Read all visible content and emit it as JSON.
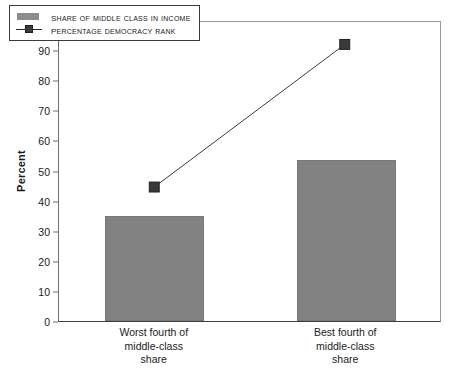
{
  "chart_data": {
    "type": "bar",
    "title": "",
    "subtitle": "",
    "xlabel": "",
    "ylabel": "Percent",
    "ylim": [
      0,
      100
    ],
    "ytick_step": 10,
    "grid": false,
    "legend_position": "top-left",
    "categories": [
      "Worst fourth of\nmiddle-class\nshare",
      "Best fourth of\nmiddle-class\nshare"
    ],
    "category_lines": [
      [
        "Worst fourth of",
        "middle-class",
        "share"
      ],
      [
        "Best fourth of",
        "middle-class",
        "share"
      ]
    ],
    "yticks": [
      0,
      10,
      20,
      30,
      40,
      50,
      60,
      70,
      80,
      90,
      100
    ],
    "series": [
      {
        "name": "Share of middle class in income",
        "type": "bar",
        "values": [
          35.0,
          53.5
        ],
        "color": "#828282"
      },
      {
        "name": "Percentage democracy rank",
        "type": "line",
        "values": [
          44.8,
          92.5
        ],
        "color": "#3a3a3a",
        "marker": "square"
      }
    ],
    "legend": [
      {
        "label": "Share of middle class in income",
        "key": "swatch",
        "color": "#8d8d8d"
      },
      {
        "label": "Percentage democracy rank",
        "key": "line-marker",
        "color": "#3a3a3a"
      }
    ]
  },
  "colors": {
    "bar_fill": "#828282",
    "line": "#3a3a3a",
    "marker": "#3a3a3a",
    "axis": "#6e6e6e",
    "text": "#1a1a1a",
    "background": "#ffffff"
  }
}
